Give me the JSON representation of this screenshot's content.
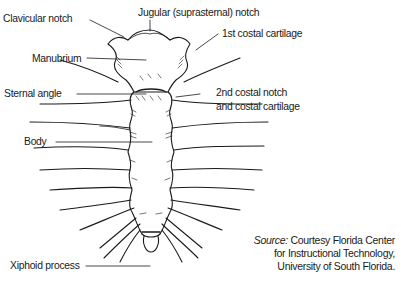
{
  "figure": {
    "labels": {
      "clavicular_notch": "Clavicular notch",
      "jugular_notch": "Jugular (suprasternal) notch",
      "first_costal": "1st costal cartilage",
      "manubrium": "Manubrium",
      "sternal_angle": "Sternal angle",
      "second_costal_line1": "2nd costal notch",
      "second_costal_line2": "and costal cartilage",
      "body": "Body",
      "xiphoid": "Xiphoid process"
    },
    "source": {
      "prefix": "Source:",
      "line1": " Courtesy Florida Center",
      "line2": "for Instructional Technology,",
      "line3": "University of South Florida."
    },
    "colors": {
      "ink": "#1a1a1a",
      "background": "#ffffff"
    }
  }
}
